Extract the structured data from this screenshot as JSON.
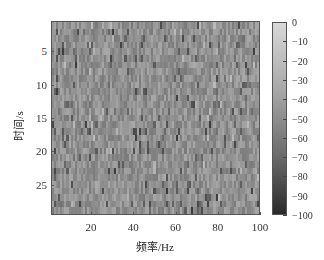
{
  "chart_data": {
    "type": "heatmap",
    "title": "",
    "xlabel": "频率/Hz",
    "ylabel": "时间/s",
    "x_ticks": [
      20,
      40,
      60,
      80,
      100
    ],
    "y_ticks": [
      5,
      10,
      15,
      20,
      25
    ],
    "xlim": [
      1,
      100
    ],
    "ylim": [
      0.5,
      29.5
    ],
    "y_inverted": true,
    "grid": false,
    "n_cols": 100,
    "n_rows": 29,
    "colormap": "gray",
    "colorbar": {
      "range": [
        -100,
        0
      ],
      "ticks": [
        0,
        -10,
        -20,
        -30,
        -40,
        -50,
        -60,
        -70,
        -80,
        -90,
        -100
      ],
      "position": "right"
    },
    "value_distribution": {
      "typical_range": [
        -60,
        -30
      ],
      "mean": -45,
      "description": "Noise-like random spectrogram; cell values mostly in -60 to -30 dB with occasional darker cells near -80"
    }
  }
}
